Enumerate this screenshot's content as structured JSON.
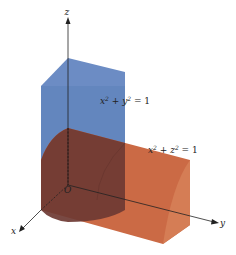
{
  "figure": {
    "axes": {
      "x_label": "x",
      "y_label": "y",
      "z_label": "z",
      "origin_label": "O"
    },
    "surfaces": [
      {
        "equation_base": "x",
        "exp1": "2",
        "mid": " + y",
        "exp2": "2",
        "rhs": " = 1",
        "color": "#5a7db8"
      },
      {
        "equation_base": "x",
        "exp1": "2",
        "mid": " + z",
        "exp2": "2",
        "rhs": " = 1",
        "color": "#c8643e"
      }
    ],
    "colors": {
      "blue_side": "#5b7fbb",
      "blue_top": "#6c8cc4",
      "orange_side": "#cb6a45",
      "orange_cap": "#d27a52",
      "overlap": "#6e3a33",
      "axis": "#222222"
    }
  }
}
